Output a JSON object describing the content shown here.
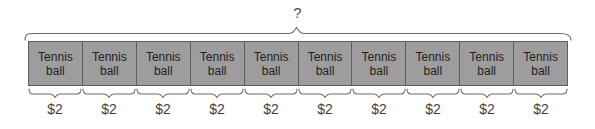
{
  "diagram": {
    "type": "tape-diagram",
    "total_label": "?",
    "unit_count": 10,
    "unit_item_line1": "Tennis",
    "unit_item_line2": "ball",
    "unit_value": "$2",
    "bar_fill_color": "#9d9d9d",
    "bar_border_color": "#5e5e5e",
    "background_color": "#ffffff",
    "cells": [
      {
        "line1": "Tennis",
        "line2": "ball"
      },
      {
        "line1": "Tennis",
        "line2": "ball"
      },
      {
        "line1": "Tennis",
        "line2": "ball"
      },
      {
        "line1": "Tennis",
        "line2": "ball"
      },
      {
        "line1": "Tennis",
        "line2": "ball"
      },
      {
        "line1": "Tennis",
        "line2": "ball"
      },
      {
        "line1": "Tennis",
        "line2": "ball"
      },
      {
        "line1": "Tennis",
        "line2": "ball"
      },
      {
        "line1": "Tennis",
        "line2": "ball"
      },
      {
        "line1": "Tennis",
        "line2": "ball"
      }
    ],
    "unit_labels": [
      "$2",
      "$2",
      "$2",
      "$2",
      "$2",
      "$2",
      "$2",
      "$2",
      "$2",
      "$2"
    ]
  }
}
